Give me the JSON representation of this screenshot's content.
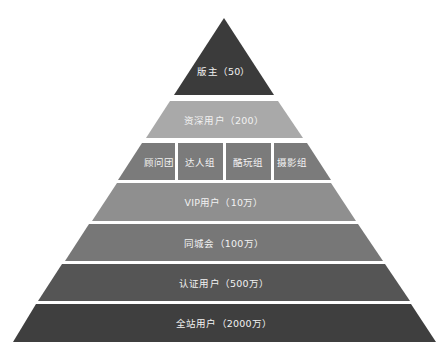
{
  "diagram": {
    "type": "pyramid",
    "tiers": [
      {
        "id": "apex",
        "label": "版主（50）",
        "color": "#3b3b3b"
      },
      {
        "id": "senior",
        "label": "资深用户（200）",
        "color": "#a9a9a9"
      },
      {
        "id": "groups",
        "color": "#7b7b7b",
        "subgroups": [
          "顾问团",
          "达人组",
          "酷玩组",
          "摄影组"
        ]
      },
      {
        "id": "vip",
        "label": "VIP用户（10万）",
        "color": "#8f8f8f"
      },
      {
        "id": "city",
        "label": "同城会（100万）",
        "color": "#777777"
      },
      {
        "id": "verified",
        "label": "认证用户（500万）",
        "color": "#555555"
      },
      {
        "id": "all",
        "label": "全站用户（2000万）",
        "color": "#3f3f3f"
      }
    ]
  }
}
